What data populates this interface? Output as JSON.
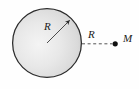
{
  "figure": {
    "background_color": "#fefefe",
    "labels": {
      "sphere_radius": "R",
      "separation_distance": "R",
      "point_mass": "M"
    },
    "sphere": {
      "center_x": 47,
      "center_y": 43,
      "radius": 35,
      "fill_light": "#f2f2f2",
      "fill_mid": "#dedede",
      "fill_dark": "#c9c9c9",
      "outline_color": "#2b2b2b",
      "outline_width": 1.2
    },
    "radius_arrow": {
      "from_x": 47,
      "from_y": 43,
      "to_x": 71,
      "to_y": 19,
      "color": "#3a3a3a",
      "arrowhead": "filled-triangle"
    },
    "dashed_segment": {
      "from_x": 82,
      "from_y": 44,
      "to_x": 113,
      "to_y": 44,
      "color": "#555555",
      "dash_pattern": "3,2.5"
    },
    "point_mass_dot": {
      "x": 115,
      "y": 44,
      "radius": 2.6,
      "color": "#111111"
    }
  }
}
